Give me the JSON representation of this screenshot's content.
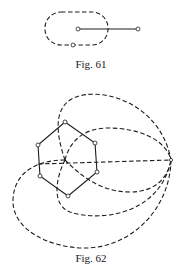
{
  "figures": [
    {
      "id": "fig61",
      "caption": "Fig. 61",
      "description": "Dashed rounded loop enclosing one endpoint of a solid segment; a node lies on the loop",
      "loop": {
        "x": 45,
        "y": 12,
        "width": 63,
        "height": 33,
        "rx": 16
      },
      "segment": {
        "x1": 78,
        "y1": 29,
        "x2": 138,
        "y2": 29
      },
      "nodes": [
        [
          78,
          29
        ],
        [
          138,
          29
        ],
        [
          73,
          45
        ]
      ]
    },
    {
      "id": "fig62",
      "caption": "Fig. 62",
      "description": "Solid hexagon with vertices as nodes; dashed curves from the center to a distant point on the right",
      "hexagon_vertices": [
        [
          65,
          122
        ],
        [
          95,
          143
        ],
        [
          97,
          172
        ],
        [
          68,
          196
        ],
        [
          40,
          176
        ],
        [
          38,
          145
        ]
      ],
      "center": [
        65,
        160
      ],
      "far_point": [
        171,
        160
      ]
    }
  ]
}
